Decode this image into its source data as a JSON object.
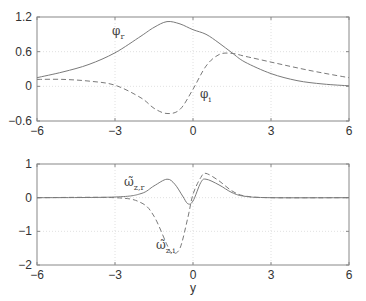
{
  "chart_data": [
    {
      "type": "line",
      "title": "",
      "xlabel": "",
      "ylabel": "",
      "xlim": [
        -6,
        6
      ],
      "ylim": [
        -0.6,
        1.2
      ],
      "xticks": [
        -6,
        -3,
        0,
        3,
        6
      ],
      "yticks": [
        -0.6,
        0,
        0.6,
        1.2
      ],
      "xtick_labels": [
        "−6",
        "−3",
        "0",
        "3",
        "6"
      ],
      "ytick_labels": [
        "−0.6",
        "0",
        "0.6",
        "1.2"
      ],
      "grid": true,
      "series": [
        {
          "name": "φ_r",
          "label_main": "φ",
          "label_sub": "r",
          "style": "solid",
          "x": [
            -6,
            -5,
            -4,
            -3,
            -2,
            -1.5,
            -1,
            -0.5,
            0,
            0.5,
            1,
            1.5,
            2,
            3,
            4,
            5,
            6
          ],
          "y": [
            0.15,
            0.25,
            0.38,
            0.58,
            0.87,
            1.02,
            1.12,
            1.08,
            0.98,
            0.9,
            0.75,
            0.58,
            0.42,
            0.22,
            0.1,
            0.04,
            0.01
          ]
        },
        {
          "name": "φ_i",
          "label_main": "φ",
          "label_sub": "i",
          "style": "dashed",
          "x": [
            -6,
            -5,
            -4,
            -3,
            -2,
            -1.5,
            -1,
            -0.5,
            0,
            0.5,
            1,
            1.5,
            2,
            3,
            4,
            5,
            6
          ],
          "y": [
            0.12,
            0.12,
            0.09,
            0.02,
            -0.2,
            -0.38,
            -0.47,
            -0.4,
            -0.05,
            0.35,
            0.55,
            0.57,
            0.52,
            0.42,
            0.32,
            0.23,
            0.15
          ]
        }
      ]
    },
    {
      "type": "line",
      "title": "",
      "xlabel": "y",
      "ylabel": "",
      "xlim": [
        -6,
        6
      ],
      "ylim": [
        -2,
        1
      ],
      "xticks": [
        -6,
        -3,
        0,
        3,
        6
      ],
      "yticks": [
        -2,
        -1,
        0,
        1
      ],
      "xtick_labels": [
        "−6",
        "−3",
        "0",
        "3",
        "6"
      ],
      "ytick_labels": [
        "−2",
        "−1",
        "0",
        "1"
      ],
      "grid": true,
      "series": [
        {
          "name": "ω̃_z,r",
          "label_main": "ω̃",
          "label_sub": "z,r",
          "style": "solid",
          "x": [
            -6,
            -3,
            -2,
            -1.5,
            -1,
            -0.7,
            -0.4,
            -0.2,
            0,
            0.3,
            0.5,
            1,
            1.5,
            2,
            3,
            6
          ],
          "y": [
            0,
            0.02,
            0.12,
            0.35,
            0.55,
            0.4,
            0.05,
            -0.18,
            -0.1,
            0.45,
            0.55,
            0.38,
            0.15,
            0.04,
            0,
            0
          ]
        },
        {
          "name": "ω̃_z,i",
          "label_main": "ω̃",
          "label_sub": "z,i",
          "style": "dashed",
          "x": [
            -6,
            -3,
            -2,
            -1.5,
            -1,
            -0.8,
            -0.5,
            -0.2,
            0,
            0.3,
            0.5,
            1,
            1.5,
            2,
            3,
            6
          ],
          "y": [
            0,
            0,
            -0.15,
            -0.55,
            -1.4,
            -1.65,
            -1.5,
            -0.6,
            0.1,
            0.6,
            0.72,
            0.5,
            0.2,
            0.05,
            0,
            0
          ]
        }
      ]
    }
  ],
  "colors": {
    "line": "#7a7a7a",
    "axes": "#888888",
    "grid": "#d8d8d8",
    "text": "#333333"
  }
}
